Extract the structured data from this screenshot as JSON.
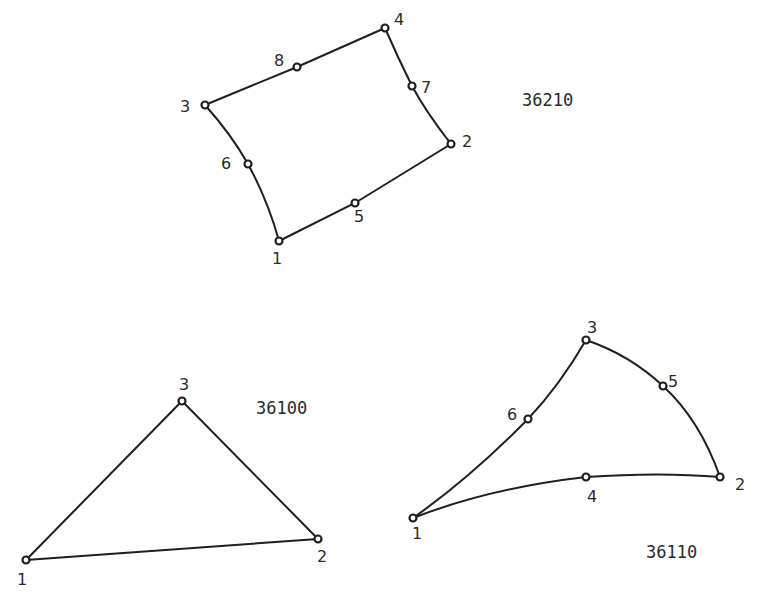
{
  "diagram": {
    "title": "",
    "elements": [
      {
        "id": "36210",
        "label": "36210",
        "shape": "quadrilateral",
        "node_labels": [
          "1",
          "2",
          "3",
          "4",
          "5",
          "6",
          "7",
          "8"
        ],
        "corner_nodes": [
          "1",
          "2",
          "4",
          "3"
        ],
        "midside_nodes": [
          "5",
          "7",
          "8",
          "6"
        ],
        "edges": [
          [
            "1",
            "5",
            "2"
          ],
          [
            "2",
            "7",
            "4"
          ],
          [
            "4",
            "8",
            "3"
          ],
          [
            "3",
            "6",
            "1"
          ]
        ]
      },
      {
        "id": "36100",
        "label": "36100",
        "shape": "triangle",
        "node_labels": [
          "1",
          "2",
          "3"
        ],
        "corner_nodes": [
          "1",
          "2",
          "3"
        ],
        "midside_nodes": [],
        "edges": [
          [
            "1",
            "2"
          ],
          [
            "2",
            "3"
          ],
          [
            "3",
            "1"
          ]
        ]
      },
      {
        "id": "36110",
        "label": "36110",
        "shape": "triangle",
        "node_labels": [
          "1",
          "2",
          "3",
          "4",
          "5",
          "6"
        ],
        "corner_nodes": [
          "1",
          "2",
          "3"
        ],
        "midside_nodes": [
          "4",
          "5",
          "6"
        ],
        "edges": [
          [
            "1",
            "4",
            "2"
          ],
          [
            "2",
            "5",
            "3"
          ],
          [
            "3",
            "6",
            "1"
          ]
        ]
      }
    ]
  }
}
